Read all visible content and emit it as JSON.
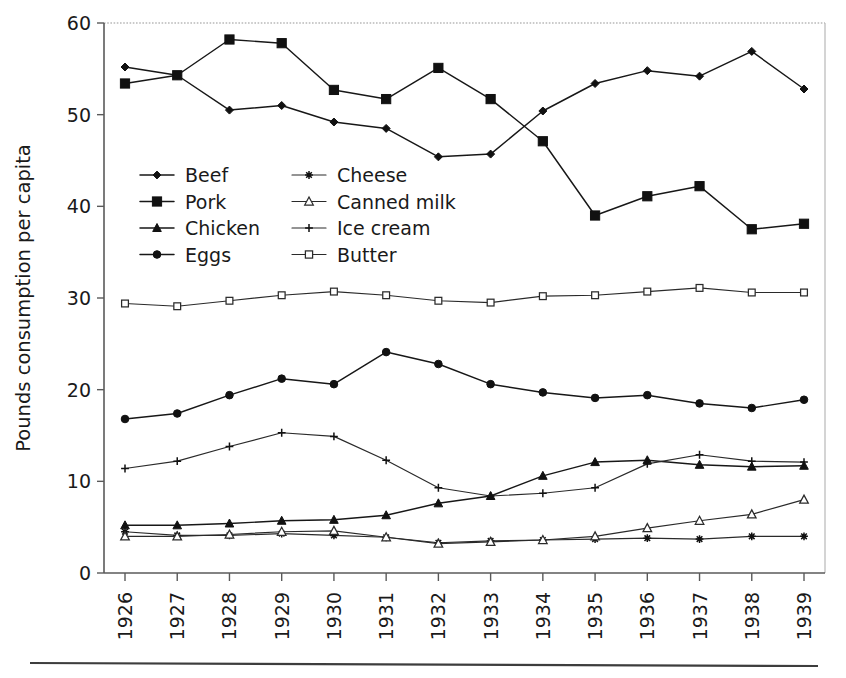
{
  "chart_data": {
    "type": "line",
    "title": "",
    "xlabel": "",
    "ylabel": "Pounds consumption per capita",
    "ylim": [
      0,
      60
    ],
    "yticks": [
      0,
      10,
      20,
      30,
      40,
      50,
      60
    ],
    "ytick_labels": [
      "0",
      "10",
      "20",
      "30",
      "40",
      "50",
      "60"
    ],
    "grid": false,
    "legend_position": "upper-left-inside",
    "legend_columns": 2,
    "categories": [
      "1926",
      "1927",
      "1928",
      "1929",
      "1930",
      "1931",
      "1932",
      "1933",
      "1934",
      "1935",
      "1936",
      "1937",
      "1938",
      "1939"
    ],
    "series": [
      {
        "name": "Beef",
        "marker": "diamond-filled",
        "values": [
          55.2,
          54.3,
          50.5,
          51.0,
          49.2,
          48.5,
          45.4,
          45.7,
          50.4,
          53.4,
          54.8,
          54.2,
          56.9,
          52.8
        ]
      },
      {
        "name": "Pork",
        "marker": "square-filled",
        "values": [
          53.4,
          54.3,
          58.2,
          57.8,
          52.7,
          51.7,
          55.1,
          51.7,
          47.1,
          39.0,
          41.1,
          42.2,
          37.5,
          38.1
        ]
      },
      {
        "name": "Chicken",
        "marker": "triangle-filled",
        "values": [
          5.2,
          5.2,
          5.4,
          5.7,
          5.8,
          6.3,
          7.6,
          8.4,
          10.6,
          12.1,
          12.3,
          11.8,
          11.6,
          11.7
        ]
      },
      {
        "name": "Eggs",
        "marker": "circle-filled",
        "values": [
          16.8,
          17.4,
          19.4,
          21.2,
          20.6,
          24.1,
          22.8,
          20.6,
          19.7,
          19.1,
          19.4,
          18.5,
          18.0,
          18.9
        ]
      },
      {
        "name": "Cheese",
        "marker": "asterisk",
        "values": [
          4.5,
          4.1,
          4.1,
          4.3,
          4.1,
          3.9,
          3.3,
          3.5,
          3.6,
          3.7,
          3.8,
          3.7,
          4.0,
          4.0
        ]
      },
      {
        "name": "Canned milk",
        "marker": "triangle-open",
        "values": [
          4.0,
          4.0,
          4.2,
          4.5,
          4.6,
          3.9,
          3.2,
          3.4,
          3.6,
          4.0,
          4.9,
          5.7,
          6.4,
          8.0
        ]
      },
      {
        "name": "Ice cream",
        "marker": "plus",
        "values": [
          11.4,
          12.2,
          13.8,
          15.3,
          14.9,
          12.3,
          9.3,
          8.4,
          8.7,
          9.3,
          11.9,
          12.9,
          12.2,
          12.1
        ]
      },
      {
        "name": "Butter",
        "marker": "square-open",
        "values": [
          29.4,
          29.1,
          29.7,
          30.3,
          30.7,
          30.3,
          29.7,
          29.5,
          30.2,
          30.3,
          30.7,
          31.1,
          30.6,
          30.6
        ]
      }
    ]
  },
  "legend": {
    "entries": [
      {
        "label": "Beef"
      },
      {
        "label": "Cheese"
      },
      {
        "label": "Pork"
      },
      {
        "label": "Canned milk"
      },
      {
        "label": "Chicken"
      },
      {
        "label": "Ice cream"
      },
      {
        "label": "Eggs"
      },
      {
        "label": "Butter"
      }
    ]
  }
}
